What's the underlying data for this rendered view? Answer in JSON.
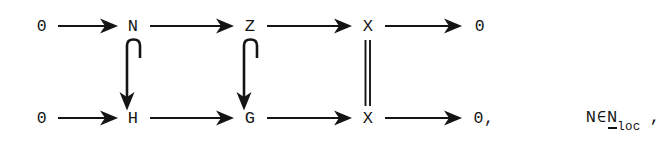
{
  "figure": {
    "type": "commutative-diagram",
    "background_color": "#ffffff",
    "ink_color": "#141414",
    "rows": [
      {
        "id": "top-row",
        "nodes": [
          {
            "label": "0",
            "x": 42,
            "y": 26
          },
          {
            "label": "N",
            "x": 133,
            "y": 26
          },
          {
            "label": "Z",
            "x": 250,
            "y": 26
          },
          {
            "label": "X",
            "x": 368,
            "y": 26
          },
          {
            "label": "0",
            "x": 480,
            "y": 26
          }
        ]
      },
      {
        "id": "bottom-row",
        "nodes": [
          {
            "label": "0",
            "x": 42,
            "y": 118
          },
          {
            "label": "H",
            "x": 133,
            "y": 118
          },
          {
            "label": "G",
            "x": 250,
            "y": 118
          },
          {
            "label": "X",
            "x": 368,
            "y": 118
          },
          {
            "label": "0,",
            "x": 484,
            "y": 118
          }
        ]
      }
    ],
    "horizontal_arrows": [
      {
        "id": "top-0-to-N",
        "row": "top",
        "x1": 58,
        "x2": 117,
        "y": 26
      },
      {
        "id": "top-N-to-Z",
        "row": "top",
        "x1": 150,
        "x2": 234,
        "y": 26
      },
      {
        "id": "top-Z-to-X",
        "row": "top",
        "x1": 267,
        "x2": 352,
        "y": 26
      },
      {
        "id": "top-X-to-0",
        "row": "top",
        "x1": 385,
        "x2": 462,
        "y": 26
      },
      {
        "id": "bot-0-to-H",
        "row": "bottom",
        "x1": 58,
        "x2": 117,
        "y": 118
      },
      {
        "id": "bot-H-to-G",
        "row": "bottom",
        "x1": 150,
        "x2": 234,
        "y": 118
      },
      {
        "id": "bot-G-to-X",
        "row": "bottom",
        "x1": 267,
        "x2": 352,
        "y": 118
      },
      {
        "id": "bot-X-to-0",
        "row": "bottom",
        "x1": 385,
        "x2": 462,
        "y": 118
      }
    ],
    "vertical_connectors": [
      {
        "id": "N-to-H",
        "kind": "hook-arrow",
        "x": 133,
        "y1": 40,
        "y2": 104
      },
      {
        "id": "Z-to-G",
        "kind": "hook-arrow",
        "x": 250,
        "y1": 40,
        "y2": 104
      },
      {
        "id": "X-to-X",
        "kind": "double-line",
        "x": 368,
        "y1": 40,
        "y2": 104
      }
    ],
    "condition": {
      "x": 545,
      "y": 118,
      "variable": "N",
      "membership_symbol": "∈",
      "set_base": "N",
      "set_subscript": "loc",
      "trailing_punctuation": ","
    }
  }
}
